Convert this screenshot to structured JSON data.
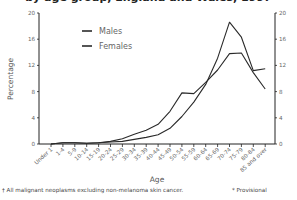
{
  "title": "by age group, England and Wales, 1997",
  "footnotes": {
    "left": "† All malignant neoplasms excluding non-melanoma skin cancer.",
    "right": "* Provisional"
  },
  "chart_data": {
    "type": "line",
    "title": "by age group, England and Wales, 1997",
    "xlabel": "Age",
    "ylabel": "Percentage",
    "ylim": [
      0,
      20
    ],
    "yticks": [
      0,
      4,
      8,
      12,
      16,
      20
    ],
    "y_axis_right": true,
    "grid": false,
    "legend_position": "top-left",
    "categories": [
      "Under 1",
      "1-4",
      "5-9",
      "10-14",
      "15-19",
      "20-24",
      "25-29",
      "30-34",
      "35-39",
      "40-44",
      "45-49",
      "50-54",
      "55-59",
      "60-64",
      "65-69",
      "70-74",
      "75-79",
      "80-84",
      "85 and over"
    ],
    "series": [
      {
        "name": "Males",
        "values": [
          0.0,
          0.2,
          0.2,
          0.1,
          0.2,
          0.3,
          0.4,
          0.7,
          1.0,
          1.4,
          2.4,
          4.2,
          6.4,
          9.1,
          13.1,
          18.6,
          16.3,
          11.2,
          11.5
        ]
      },
      {
        "name": "Females",
        "values": [
          0.0,
          0.2,
          0.2,
          0.1,
          0.2,
          0.4,
          0.8,
          1.5,
          2.1,
          3.0,
          5.0,
          7.8,
          7.7,
          9.4,
          11.3,
          13.8,
          13.9,
          10.9,
          8.4
        ]
      }
    ]
  }
}
